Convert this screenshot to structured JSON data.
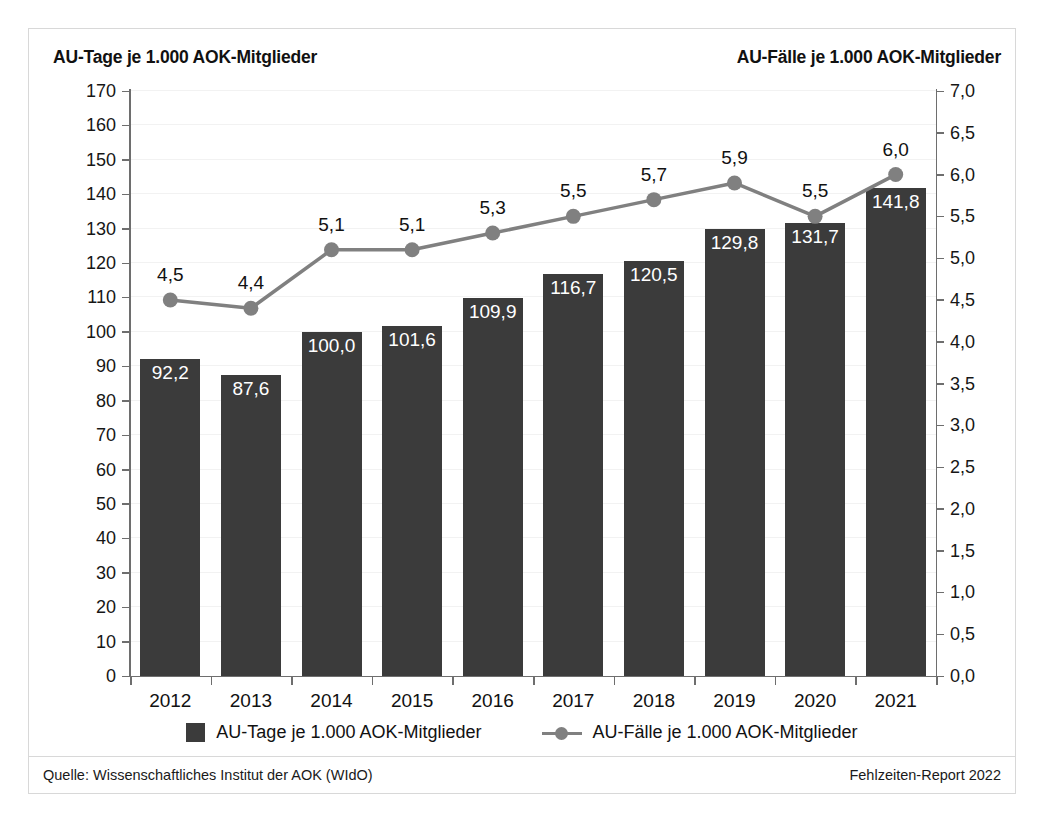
{
  "figure": {
    "left_axis_title": "AU-Tage je 1.000 AOK-Mitglieder",
    "right_axis_title": "AU-Fälle je 1.000 AOK-Mitglieder",
    "source_note": "Quelle: Wissenschaftliches Institut der AOK (WIdO)",
    "report_note": "Fehlzeiten-Report 2022",
    "bar_color": "#3b3b3b",
    "line_color": "#808080",
    "bar_label_color": "#ffffff",
    "grid_color": "#f2f2f2",
    "frame_color": "#d8d8d8"
  },
  "legend": {
    "position": "bottom-center",
    "items": [
      {
        "label": "AU-Tage je 1.000 AOK-Mitglieder",
        "marker": "square-swatch",
        "color": "#3b3b3b"
      },
      {
        "label": "AU-Fälle je 1.000 AOK-Mitglieder",
        "marker": "line-with-circle",
        "color": "#808080"
      }
    ]
  },
  "chart_data": {
    "type": "bar",
    "title": "",
    "subtitle": "",
    "xlabel": "",
    "ylabel": "AU-Tage je 1.000 AOK-Mitglieder",
    "y2label": "AU-Fälle je 1.000 AOK-Mitglieder",
    "grid": true,
    "legend_position": "bottom-center",
    "categories": [
      "2012",
      "2013",
      "2014",
      "2015",
      "2016",
      "2017",
      "2018",
      "2019",
      "2020",
      "2021"
    ],
    "ylim": [
      0,
      170
    ],
    "yticks": [
      0,
      10,
      20,
      30,
      40,
      50,
      60,
      70,
      80,
      90,
      100,
      110,
      120,
      130,
      140,
      150,
      160,
      170
    ],
    "ytick_labels": [
      "0",
      "10",
      "20",
      "30",
      "40",
      "50",
      "60",
      "70",
      "80",
      "90",
      "100",
      "110",
      "120",
      "130",
      "140",
      "150",
      "160",
      "170"
    ],
    "y2lim": [
      0,
      7
    ],
    "y2ticks": [
      0,
      0.5,
      1,
      1.5,
      2,
      2.5,
      3,
      3.5,
      4,
      4.5,
      5,
      5.5,
      6,
      6.5,
      7
    ],
    "y2tick_labels": [
      "0,0",
      "0,5",
      "1,0",
      "1,5",
      "2,0",
      "2,5",
      "3,0",
      "3,5",
      "4,0",
      "4,5",
      "5,0",
      "5,5",
      "6,0",
      "6,5",
      "7,0"
    ],
    "series": [
      {
        "name": "AU-Tage je 1.000 AOK-Mitglieder",
        "type": "bar",
        "axis": "left",
        "color": "#3b3b3b",
        "values": [
          92.2,
          87.6,
          100.0,
          101.6,
          109.9,
          116.7,
          120.5,
          129.8,
          131.7,
          141.8
        ],
        "labels": [
          "92,2",
          "87,6",
          "100,0",
          "101,6",
          "109,9",
          "116,7",
          "120,5",
          "129,8",
          "131,7",
          "141,8"
        ]
      },
      {
        "name": "AU-Fälle je 1.000 AOK-Mitglieder",
        "type": "line",
        "axis": "right",
        "color": "#808080",
        "values": [
          4.5,
          4.4,
          5.1,
          5.1,
          5.3,
          5.5,
          5.7,
          5.9,
          5.5,
          6.0
        ],
        "labels": [
          "4,5",
          "4,4",
          "5,1",
          "5,1",
          "5,3",
          "5,5",
          "5,7",
          "5,9",
          "5,5",
          "6,0"
        ]
      }
    ]
  }
}
